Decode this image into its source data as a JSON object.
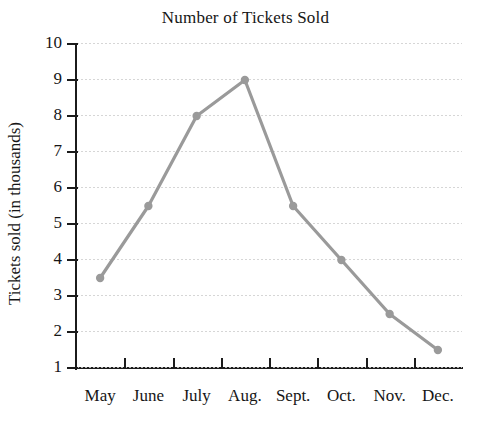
{
  "chart_data": {
    "type": "line",
    "title": "Number of Tickets Sold",
    "xlabel": "",
    "ylabel": "Tickets sold (in thousands)",
    "categories": [
      "May",
      "June",
      "July",
      "Aug.",
      "Sept.",
      "Oct.",
      "Nov.",
      "Dec."
    ],
    "values": [
      3.5,
      5.5,
      8,
      9,
      5.5,
      4,
      2.5,
      1.5
    ],
    "series": [
      {
        "name": "Tickets sold",
        "values": [
          3.5,
          5.5,
          8,
          9,
          5.5,
          4,
          2.5,
          1.5
        ]
      }
    ],
    "ylim": [
      0,
      10
    ],
    "y_ticks": [
      1,
      2,
      3,
      4,
      5,
      6,
      7,
      8,
      9,
      10
    ],
    "y_tick_labels": [
      "1",
      "2",
      "3",
      "4",
      "5",
      "6",
      "7",
      "8",
      "9",
      "10"
    ],
    "grid": true,
    "grid_axis": "y",
    "grid_style": "dotted",
    "legend": false,
    "legend_position": "none",
    "markers": true,
    "marker_shape": "circle",
    "colors": {
      "line": "#9a9a9a",
      "marker": "#9a9a9a",
      "axis": "#1b1b1b",
      "grid": "#cfcfcf",
      "text": "#161616",
      "background": "#ffffff"
    }
  }
}
